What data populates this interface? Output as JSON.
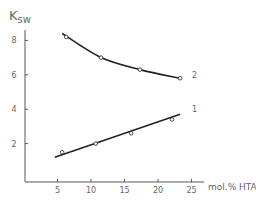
{
  "chart_data": {
    "type": "line",
    "title": "",
    "ylabel": "Ksw",
    "ylabel_main": "K",
    "ylabel_sub": "sw",
    "xlabel": "mol.% HTA",
    "xlim": [
      0,
      26
    ],
    "ylim": [
      0,
      8.5
    ],
    "xticks": [
      5,
      10,
      15,
      20,
      25
    ],
    "yticks": [
      2,
      4,
      6,
      8
    ],
    "grid": false,
    "legend": "inline curve labels",
    "series": [
      {
        "name": "1",
        "fit": "linear",
        "points": [
          [
            5.7,
            1.5
          ],
          [
            10.7,
            2.0
          ],
          [
            16.0,
            2.6
          ],
          [
            22.1,
            3.4
          ]
        ],
        "line": [
          [
            4.6,
            1.2
          ],
          [
            23.3,
            3.7
          ]
        ]
      },
      {
        "name": "2",
        "fit": "curve",
        "points": [
          [
            6.3,
            8.2
          ],
          [
            11.5,
            7.0
          ],
          [
            17.3,
            6.3
          ],
          [
            23.3,
            5.8
          ]
        ],
        "line": [
          [
            5.7,
            8.4
          ],
          [
            11.5,
            7.0
          ],
          [
            17.3,
            6.3
          ],
          [
            23.3,
            5.8
          ]
        ]
      }
    ]
  }
}
